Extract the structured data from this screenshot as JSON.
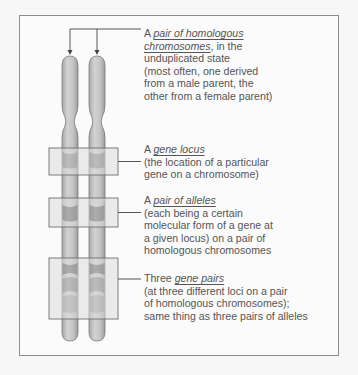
{
  "diagram": {
    "colors": {
      "background": "#f7f7f7",
      "frame_border": "#8c8c8c",
      "frame_fill": "#fbfbfb",
      "chromosome_fill": "#c9c9c9",
      "chromosome_outline": "#7a7a7a",
      "band_medium": "#8c8c8c",
      "band_dark": "#6a6a6a",
      "locus_box_fill": "#e2e2e2",
      "locus_box_border": "#6f6f6f",
      "text": "#555555"
    },
    "chromosomes": [
      {
        "name": "chromosome-1",
        "label": "from one parent"
      },
      {
        "name": "chromosome-2",
        "label": "from the other parent"
      }
    ],
    "annotations": [
      {
        "id": "homologous-pair",
        "prefix": "A ",
        "term": "pair of homologous",
        "term2": "chromosomes",
        "lines": [
          ", in the",
          "unduplicated state",
          "(most often, one derived",
          "from a male parent, the",
          "other from a female parent)"
        ]
      },
      {
        "id": "gene-locus",
        "prefix": "A ",
        "term": "gene locus",
        "lines": [
          "(the location of a particular",
          "gene on a chromosome)"
        ]
      },
      {
        "id": "pair-of-alleles",
        "prefix": "A ",
        "term": "pair of alleles",
        "lines": [
          "(each being a certain",
          "molecular form of a gene at",
          "a given locus) on a pair of",
          "homologous chromosomes"
        ]
      },
      {
        "id": "gene-pairs",
        "prefix": "Three ",
        "term": "gene pairs",
        "lines": [
          "(at three different loci on a pair",
          "of homologous chromosomes);",
          "same thing as three pairs of alleles"
        ]
      }
    ]
  }
}
